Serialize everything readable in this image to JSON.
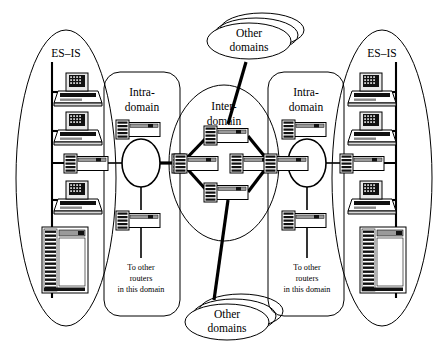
{
  "diagram": {
    "labels": {
      "es_is_left": "ES–IS",
      "es_is_right": "ES–IS",
      "intra_left_line1": "Intra-",
      "intra_left_line2": "domain",
      "intra_right_line1": "Intra-",
      "intra_right_line2": "domain",
      "inter_line1": "Inter-",
      "inter_line2": "domain",
      "other_top_line1": "Other",
      "other_top_line2": "domains",
      "other_bottom_line1": "Other",
      "other_bottom_line2": "domains",
      "to_other_left_line1": "To other",
      "to_other_left_line2": "routers",
      "to_other_left_line3": "in this domain",
      "to_other_right_line1": "To other",
      "to_other_right_line2": "routers",
      "to_other_right_line3": "in this domain"
    },
    "colors": {
      "stroke": "#000000",
      "background": "#ffffff",
      "device_fill": "#ffffff",
      "device_dark": "#1a1a1a",
      "device_gray": "#9a9a9a"
    },
    "regions": [
      {
        "name": "es-is-left",
        "shape": "ellipse",
        "label": "ES–IS"
      },
      {
        "name": "intra-domain-left",
        "shape": "rounded-rect",
        "label": "Intra-domain"
      },
      {
        "name": "inter-domain",
        "shape": "ellipse",
        "label": "Inter-domain"
      },
      {
        "name": "intra-domain-right",
        "shape": "rounded-rect",
        "label": "Intra-domain"
      },
      {
        "name": "es-is-right",
        "shape": "ellipse",
        "label": "ES–IS"
      },
      {
        "name": "other-domains-top",
        "shape": "stacked-ellipse",
        "label": "Other domains"
      },
      {
        "name": "other-domains-bottom",
        "shape": "stacked-ellipse",
        "label": "Other domains"
      }
    ],
    "devices": {
      "workstations_left": 3,
      "workstations_right": 3,
      "servers_left": 1,
      "servers_right": 1,
      "routers_inter_domain": 4,
      "routers_intra_left": 4,
      "routers_intra_right": 4
    }
  }
}
